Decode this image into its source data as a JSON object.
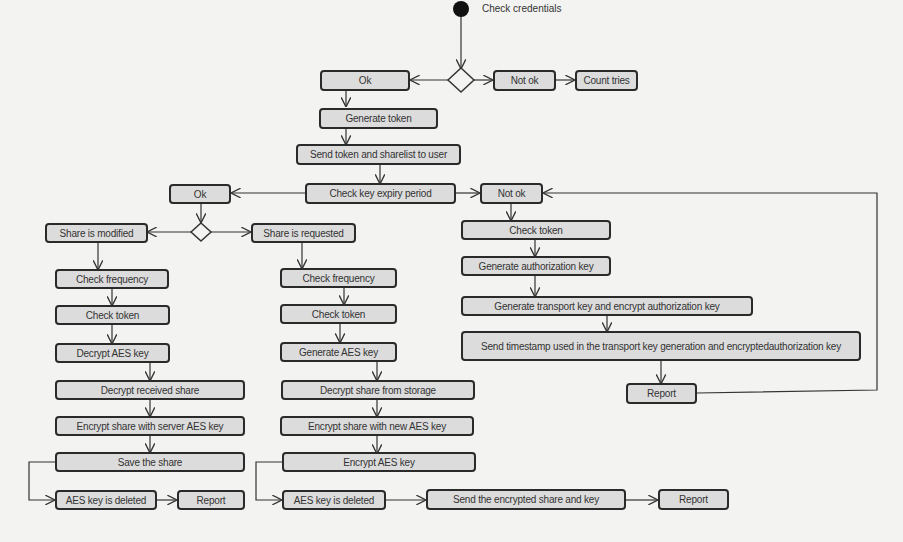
{
  "diagram": {
    "start_label": "Check credentials",
    "nodes": {
      "ok_top": "Ok",
      "not_ok_top": "Not ok",
      "count_tries": "Count tries",
      "generate_token": "Generate token",
      "send_token": "Send token and sharelist to user",
      "check_expiry": "Check key expiry period",
      "ok_mid": "Ok",
      "not_ok_mid": "Not ok",
      "share_modified": "Share is modified",
      "share_requested": "Share is requested",
      "l_check_frequency": "Check frequency",
      "l_check_token": "Check token",
      "l_decrypt_aes": "Decrypt AES key",
      "l_decrypt_received": "Decrypt received share",
      "l_encrypt_server": "Encrypt share with server AES key",
      "l_save_share": "Save the share",
      "l_aes_deleted": "AES key is deleted",
      "l_report": "Report",
      "m_check_frequency": "Check frequency",
      "m_check_token": "Check token",
      "m_generate_aes": "Generate AES key",
      "m_decrypt_storage": "Decrypt share from storage",
      "m_encrypt_new": "Encrypt share with new AES key",
      "m_encrypt_aes": "Encrypt AES key",
      "m_aes_deleted": "AES key is deleted",
      "m_send_encrypted": "Send the encrypted share and key",
      "m_report": "Report",
      "r_check_token": "Check token",
      "r_generate_auth": "Generate authorization key",
      "r_generate_transport": "Generate transport key and encrypt authorization key",
      "r_send_timestamp": "Send timestamp used in the transport key generation and encryptedauthorization key",
      "r_report": "Report"
    }
  }
}
